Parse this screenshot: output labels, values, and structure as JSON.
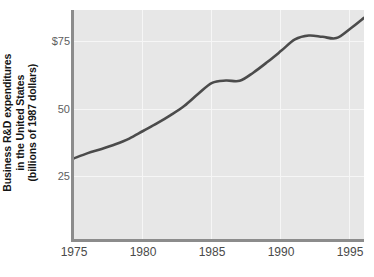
{
  "chart_data": {
    "type": "line",
    "title": "",
    "xlabel": "",
    "ylabel": "Business R&D expenditures in the United States (billions of 1987 dollars)",
    "ylabel_lines": [
      "Business R&D expenditures",
      "in the United States",
      "(billions of 1987 dollars)"
    ],
    "xlim": [
      1975,
      1996
    ],
    "ylim": [
      0,
      88
    ],
    "grid": true,
    "legend": null,
    "y_ticks": [
      {
        "value": 25,
        "label": "25"
      },
      {
        "value": 50,
        "label": "50"
      },
      {
        "value": 75,
        "label": "$75"
      }
    ],
    "x_ticks": [
      {
        "value": 1975,
        "label": "1975"
      },
      {
        "value": 1980,
        "label": "1980"
      },
      {
        "value": 1985,
        "label": "1985"
      },
      {
        "value": 1990,
        "label": "1990"
      },
      {
        "value": 1995,
        "label": "1995"
      }
    ],
    "series": [
      {
        "name": "Business R&D expenditures",
        "color": "#4b4b4b",
        "x": [
          1975,
          1976,
          1977,
          1978,
          1979,
          1980,
          1981,
          1982,
          1983,
          1984,
          1985,
          1986,
          1987,
          1988,
          1989,
          1990,
          1991,
          1992,
          1993,
          1994,
          1995,
          1996
        ],
        "values": [
          31.0,
          33.0,
          34.6,
          36.4,
          38.6,
          41.5,
          44.4,
          47.6,
          51.2,
          55.8,
          60.0,
          60.9,
          60.8,
          64.0,
          68.0,
          72.3,
          76.7,
          78.2,
          77.7,
          77.2,
          80.8,
          85.0
        ]
      }
    ],
    "colors": {
      "plot_background": "#e7e7e7",
      "page_background": "#ffffff",
      "axis": "#8c8c8c",
      "gridline": "#f6f6f6",
      "line": "#4b4b4b",
      "tick_text": "#4a4a4a",
      "ylabel_text": "#151515"
    }
  }
}
